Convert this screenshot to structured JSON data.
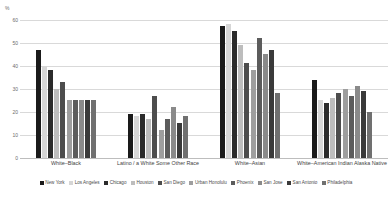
{
  "chart_data": {
    "type": "bar",
    "title": "",
    "subtitle": "",
    "xlabel": "",
    "ylabel": "%",
    "ylim": [
      0,
      65
    ],
    "yticks": [
      0,
      10,
      20,
      30,
      40,
      50,
      60
    ],
    "grid": true,
    "legend_position": "bottom",
    "categories": [
      "White–Black",
      "Latino / a White Some Other Race",
      "White–Asian",
      "White–American Indian Alaska Native"
    ],
    "series": [
      {
        "name": "New York",
        "color": "#1a1a1a",
        "values": [
          47,
          19,
          57,
          34
        ]
      },
      {
        "name": "Los Angeles",
        "color": "#d6d6d6",
        "values": [
          40,
          18,
          58,
          25
        ]
      },
      {
        "name": "Chicago",
        "color": "#2b2b2b",
        "values": [
          38,
          19,
          55,
          24
        ]
      },
      {
        "name": "Houston",
        "color": "#bdbdbd",
        "values": [
          30,
          17,
          49,
          26
        ]
      },
      {
        "name": "San Diego",
        "color": "#4d4d4d",
        "values": [
          33,
          27,
          41,
          28
        ]
      },
      {
        "name": "Urban Honolulu",
        "color": "#9e9e9e",
        "values": [
          25,
          12,
          38,
          30
        ]
      },
      {
        "name": "Phoenix",
        "color": "#5c5c5c",
        "values": [
          25,
          17,
          52,
          27
        ]
      },
      {
        "name": "San Jose",
        "color": "#8a8a8a",
        "values": [
          25,
          22,
          45,
          31
        ]
      },
      {
        "name": "San Antonio",
        "color": "#3a3a3a",
        "values": [
          25,
          15,
          47,
          29
        ]
      },
      {
        "name": "Philadelphia",
        "color": "#707070",
        "values": [
          25,
          18,
          28,
          20
        ]
      }
    ]
  },
  "axis": {
    "unit_label": "%",
    "tick_labels": [
      "60",
      "50",
      "40",
      "30",
      "20",
      "10",
      "0"
    ]
  }
}
